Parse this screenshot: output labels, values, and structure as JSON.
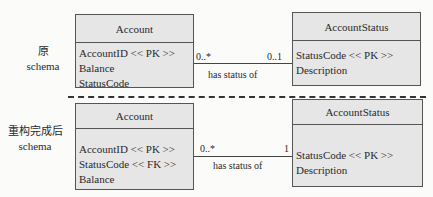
{
  "sections": [
    {
      "label_line1": "原",
      "label_line2": "schema",
      "left_entity": {
        "name": "Account",
        "attributes": [
          "AccountID << PK >>",
          "Balance",
          "StatusCode"
        ]
      },
      "right_entity": {
        "name": "AccountStatus",
        "attributes": [
          "StatusCode << PK >>",
          "Description"
        ]
      },
      "relationship": {
        "label": "has status of",
        "left_multiplicity": "0..*",
        "right_multiplicity": "0..1"
      }
    },
    {
      "label_line1": "重构完成后",
      "label_line2": "schema",
      "left_entity": {
        "name": "Account",
        "attributes": [
          "AccountID << PK >>",
          "StatusCode << FK >>",
          "Balance"
        ]
      },
      "right_entity": {
        "name": "AccountStatus",
        "attributes": [
          "StatusCode << PK >>",
          "Description"
        ]
      },
      "relationship": {
        "label": "has status of",
        "left_multiplicity": "0..*",
        "right_multiplicity": "1"
      }
    }
  ]
}
